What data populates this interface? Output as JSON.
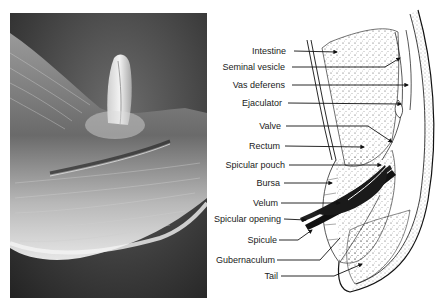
{
  "figure": {
    "left_panel": {
      "type": "scanning-electron-micrograph",
      "subject": "nematode male tail with protruding spicule"
    },
    "right_panel": {
      "type": "labeled-anatomical-diagram",
      "labels": [
        {
          "text": "Intestine",
          "y": 51
        },
        {
          "text": "Seminal vesicle",
          "y": 67
        },
        {
          "text": "Vas deferens",
          "y": 85
        },
        {
          "text": "Ejaculator",
          "y": 103
        },
        {
          "text": "Valve",
          "y": 126
        },
        {
          "text": "Rectum",
          "y": 146
        },
        {
          "text": "Spicular pouch",
          "y": 165
        },
        {
          "text": "Bursa",
          "y": 183
        },
        {
          "text": "Velum",
          "y": 203
        },
        {
          "text": "Spicular opening",
          "y": 219
        },
        {
          "text": "Spicule",
          "y": 240
        },
        {
          "text": "Gubernaculum",
          "y": 260
        },
        {
          "text": "Tail",
          "y": 276
        }
      ]
    }
  }
}
